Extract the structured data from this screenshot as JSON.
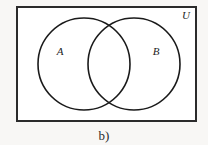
{
  "figure": {
    "caption": "b)",
    "background_color": "#f8f7f5",
    "universe": {
      "label": "U",
      "label_name": "universal-set-label",
      "fill_color": "#ffffff",
      "border_color": "#2b2b2b",
      "border_width": 2,
      "x": 17,
      "y": 7,
      "width": 179,
      "height": 114,
      "label_x": 186,
      "label_y": 19
    },
    "sets": [
      {
        "label": "A",
        "name": "set-a",
        "cx": 84,
        "cy": 64,
        "r": 46,
        "stroke_color": "#1a1a1a",
        "stroke_width": 1.6,
        "label_x": 60,
        "label_y": 55
      },
      {
        "label": "B",
        "name": "set-b",
        "cx": 134,
        "cy": 64,
        "r": 46,
        "stroke_color": "#1a1a1a",
        "stroke_width": 1.6,
        "label_x": 156,
        "label_y": 55
      }
    ],
    "caption_x": 104,
    "caption_y": 140
  }
}
